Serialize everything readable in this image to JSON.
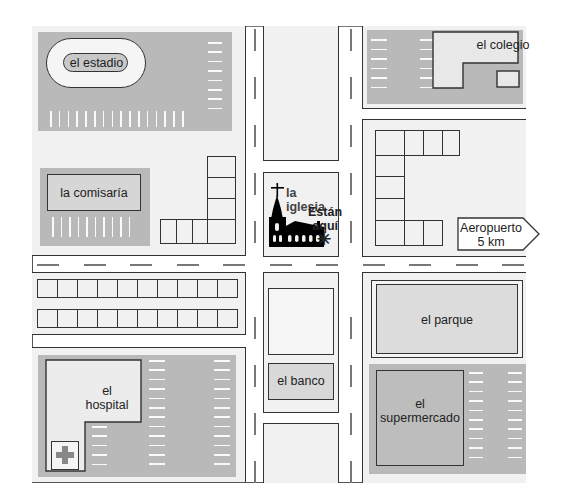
{
  "map": {
    "title": "Town map",
    "places": {
      "stadium": "el estadio",
      "police": "la comisaría",
      "church": "la iglesia",
      "school": "el colegio",
      "airport_sign_line1": "Aeropuerto",
      "airport_sign_line2": "5 km",
      "you_are_here_line1": "Están",
      "you_are_here_line2": "aquí",
      "park": "el parque",
      "bank": "el banco",
      "hospital_line1": "el",
      "hospital_line2": "hospital",
      "supermarket_line1": "el",
      "supermarket_line2": "supermercado"
    },
    "icons": {
      "cross": "cross-icon",
      "church": "church-icon",
      "here_marker": "asterisk-icon",
      "hospital_cross": "medical-cross-icon",
      "arrow": "arrow-sign-icon"
    },
    "colors": {
      "street": "#ffffff",
      "block": "#f1f1f1",
      "parking": "#b9b9b9",
      "outline": "#333333",
      "church": "#000000"
    }
  }
}
